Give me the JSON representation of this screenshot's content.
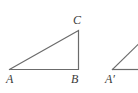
{
  "figure": {
    "type": "geometry-diagram",
    "background_color": "#ffffff",
    "stroke_color": "#6b6b6b",
    "label_color": "#3a3a3a",
    "stroke_width": 1.2,
    "canvas": {
      "width": 138,
      "height": 93
    },
    "shapes": [
      {
        "name": "triangle-ABC",
        "kind": "polyline",
        "closed": false,
        "points": "9.5,69.5 78.5,69.5 78.5,30.5 9.5,69.5"
      },
      {
        "name": "triangle-A-prime-partial-base",
        "kind": "line",
        "points": "112.5,69.5 138,69.5"
      },
      {
        "name": "triangle-A-prime-partial-hypotenuse",
        "kind": "line",
        "points": "112.5,69.5 138,44.5"
      }
    ],
    "labels": [
      {
        "id": "C",
        "text": "C",
        "prime": ""
      },
      {
        "id": "A",
        "text": "A",
        "prime": ""
      },
      {
        "id": "B",
        "text": "B",
        "prime": ""
      },
      {
        "id": "Aprime",
        "text": "A",
        "prime": "′"
      }
    ]
  }
}
